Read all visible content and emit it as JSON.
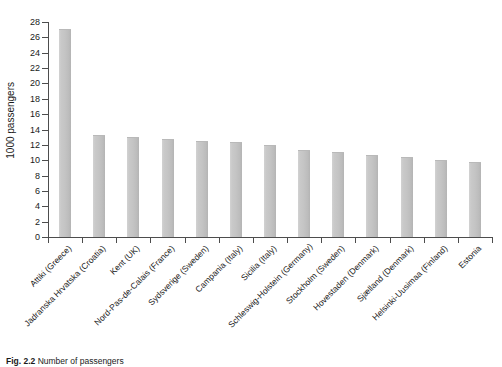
{
  "chart_data": {
    "type": "bar",
    "title": "",
    "xlabel": "",
    "ylabel": "1000 passengers",
    "ylim": [
      0,
      28
    ],
    "ytick_step": 2,
    "grid": false,
    "legend": "none",
    "bar_color": "#c4c4c4",
    "axis_color": "#4d4d4d",
    "categories": [
      "Attiki (Greece)",
      "Jadranska Hrvatska (Croatia)",
      "Kent (UK)",
      "Nord-Pas-de-Calais (France)",
      "Sydsverige (Sweden)",
      "Campania (Italy)",
      "Sicilia (Italy)",
      "Schleswig-Holstein (Germany)",
      "Stockholm (Sweden)",
      "Hovestaden (Denmark)",
      "Sjælland (Denmark)",
      "Helsinki-Uusimaa (Finland)",
      "Estonia"
    ],
    "values": [
      27.0,
      13.2,
      12.9,
      12.6,
      12.4,
      12.2,
      11.8,
      11.2,
      10.9,
      10.5,
      10.3,
      9.9,
      9.7
    ],
    "ytick_labels": [
      "0",
      "2",
      "4",
      "6",
      "8",
      "10",
      "12",
      "14",
      "16",
      "18",
      "20",
      "22",
      "24",
      "26",
      "28"
    ]
  },
  "caption": {
    "label": "Fig. 2.2",
    "text": "Number of passengers"
  }
}
